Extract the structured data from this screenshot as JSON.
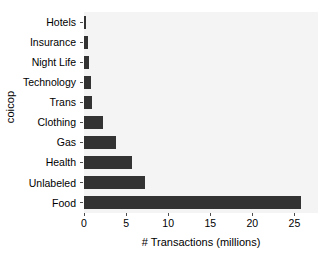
{
  "chart_data": {
    "type": "bar",
    "orientation": "horizontal",
    "title": "",
    "xlabel": "# Transactions (millions)",
    "ylabel": "coicop",
    "categories": [
      "Hotels",
      "Insurance",
      "Night Life",
      "Technology",
      "Trans",
      "Clothing",
      "Gas",
      "Health",
      "Unlabeled",
      "Food"
    ],
    "values": [
      0.25,
      0.45,
      0.6,
      0.85,
      0.95,
      2.3,
      3.8,
      5.7,
      7.3,
      25.8
    ],
    "xlim": [
      0,
      27.8
    ],
    "ylim": null,
    "xticks": [
      0,
      5,
      10,
      15,
      20,
      25
    ],
    "xtick_labels": [
      "0",
      "5",
      "10",
      "15",
      "20",
      "25"
    ],
    "grid": false,
    "legend": null,
    "bar_color": "#333333",
    "panel_color": "#f4f4f4",
    "axis_color": "#4d4d4d",
    "text_color": "#000000"
  },
  "axes": {
    "x_title": "# Transactions (millions)",
    "y_title": "coicop"
  }
}
